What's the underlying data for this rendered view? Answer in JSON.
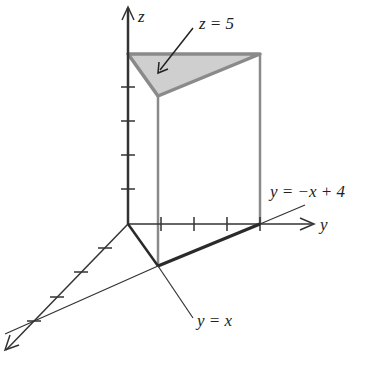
{
  "figure": {
    "axes": {
      "z_label": "z",
      "y_label": "y",
      "x_label": "x"
    },
    "annotations": {
      "top_face": "z = 5",
      "line_back": "y = −x + 4",
      "line_front": "y = x"
    },
    "colors": {
      "axis": "#333333",
      "edge": "#8a8a8a",
      "base_edge": "#2a2a2a",
      "top_fill": "#cfcfcf"
    },
    "ticks": {
      "z": [
        1,
        2,
        3,
        4
      ],
      "y": [
        1,
        2,
        3,
        4
      ],
      "x": [
        1,
        2,
        3,
        4
      ]
    }
  }
}
